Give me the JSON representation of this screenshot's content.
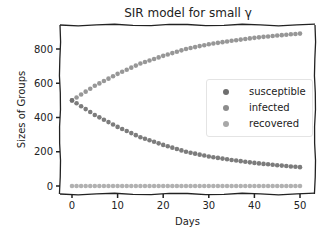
{
  "chart_data": {
    "type": "scatter",
    "title": "SIR model for small γ",
    "xlabel": "Days",
    "ylabel": "Sizes of Groups",
    "xlim": [
      -2,
      52
    ],
    "ylim": [
      -45,
      960
    ],
    "xticks": [
      0,
      10,
      20,
      30,
      40,
      50
    ],
    "yticks": [
      0,
      200,
      400,
      600,
      800
    ],
    "grid": false,
    "legend_position": "center right",
    "x": [
      0,
      1,
      2,
      3,
      4,
      5,
      6,
      7,
      8,
      9,
      10,
      11,
      12,
      13,
      14,
      15,
      16,
      17,
      18,
      19,
      20,
      21,
      22,
      23,
      24,
      25,
      26,
      27,
      28,
      29,
      30,
      31,
      32,
      33,
      34,
      35,
      36,
      37,
      38,
      39,
      40,
      41,
      42,
      43,
      44,
      45,
      46,
      47,
      48,
      49,
      50
    ],
    "series": [
      {
        "name": "susceptible",
        "color": "#6e6e6e",
        "values": [
          500,
          483,
          466,
          449,
          432,
          415,
          401,
          387,
          373,
          359,
          345,
          333,
          321,
          309,
          297,
          285,
          276,
          267,
          258,
          249,
          240,
          232,
          224,
          216,
          208,
          200,
          194,
          189,
          183,
          178,
          172,
          168,
          164,
          160,
          156,
          152,
          149,
          145,
          142,
          138,
          135,
          132,
          129,
          127,
          124,
          121,
          119,
          117,
          114,
          112,
          110
        ]
      },
      {
        "name": "infected",
        "color": "#8c8c8c",
        "values": [
          500,
          517,
          534,
          551,
          568,
          585,
          599,
          613,
          627,
          641,
          655,
          667,
          679,
          691,
          703,
          715,
          724,
          733,
          742,
          751,
          760,
          768,
          776,
          784,
          792,
          800,
          806,
          811,
          817,
          822,
          828,
          832,
          836,
          840,
          844,
          848,
          851,
          855,
          858,
          862,
          865,
          868,
          871,
          873,
          876,
          879,
          881,
          883,
          886,
          888,
          890
        ]
      },
      {
        "name": "recovered",
        "color": "#a8a8a8",
        "values": [
          0,
          0,
          0,
          0,
          0,
          0,
          0,
          0,
          0,
          0,
          0,
          0,
          0,
          0,
          0,
          0,
          0,
          0,
          0,
          0,
          0,
          0,
          0,
          0,
          0,
          0,
          0,
          0,
          0,
          0,
          0,
          0,
          0,
          0,
          0,
          0,
          0,
          0,
          0,
          0,
          0,
          0,
          0,
          0,
          0,
          0,
          0,
          0,
          0,
          0,
          0
        ]
      }
    ]
  },
  "legend": {
    "items": [
      {
        "label": "susceptible",
        "color": "#6e6e6e"
      },
      {
        "label": "infected",
        "color": "#8c8c8c"
      },
      {
        "label": "recovered",
        "color": "#a8a8a8"
      }
    ]
  }
}
